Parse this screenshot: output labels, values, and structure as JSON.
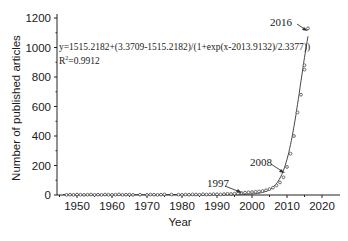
{
  "chart_data": {
    "type": "scatter",
    "title": "",
    "xlabel": "Year",
    "ylabel": "Number of published articles",
    "xlim": [
      1944,
      2020
    ],
    "ylim": [
      0,
      1200
    ],
    "xticks": [
      1950,
      1960,
      1970,
      1980,
      1990,
      2000,
      2010,
      2020
    ],
    "yticks": [
      0,
      200,
      400,
      600,
      800,
      1000,
      1200
    ],
    "grid": false,
    "legend": null,
    "fit": {
      "type": "logistic",
      "equation": "y=1515.2182+(3.3709-1515.2182)/(1+exp(x-2013.9132)/2.3377))",
      "r_squared_label": "R",
      "r_squared_sup": "2",
      "r_squared_value": "=0.9912",
      "A1": 3.3709,
      "A2": 1515.2182,
      "x0": 2013.9132,
      "dx": 2.3377
    },
    "series": [
      {
        "name": "Published articles",
        "marker": "open-circle",
        "x": [
          1947,
          1948,
          1949,
          1950,
          1951,
          1952,
          1953,
          1954,
          1955,
          1956,
          1957,
          1958,
          1959,
          1960,
          1961,
          1962,
          1963,
          1964,
          1965,
          1966,
          1968,
          1970,
          1971,
          1972,
          1973,
          1974,
          1975,
          1977,
          1979,
          1980,
          1981,
          1982,
          1983,
          1984,
          1985,
          1986,
          1987,
          1988,
          1989,
          1990,
          1991,
          1992,
          1993,
          1994,
          1995,
          1996,
          1997,
          1998,
          1999,
          2000,
          2001,
          2002,
          2003,
          2004,
          2005,
          2006,
          2007,
          2008,
          2009,
          2010,
          2011,
          2012,
          2013,
          2014,
          2015,
          2015,
          2016
        ],
        "y": [
          1,
          2,
          1,
          3,
          2,
          1,
          2,
          3,
          1,
          2,
          1,
          3,
          2,
          1,
          2,
          4,
          1,
          2,
          3,
          1,
          2,
          1,
          3,
          2,
          1,
          2,
          4,
          3,
          2,
          1,
          3,
          2,
          4,
          3,
          2,
          5,
          3,
          4,
          6,
          5,
          4,
          6,
          8,
          7,
          9,
          10,
          14,
          16,
          18,
          20,
          22,
          24,
          27,
          32,
          40,
          50,
          65,
          85,
          120,
          190,
          280,
          400,
          560,
          680,
          880,
          850,
          1130
        ]
      }
    ],
    "annotations": [
      {
        "text": "1997",
        "x": 1997,
        "y": 14
      },
      {
        "text": "2008",
        "x": 2008,
        "y": 120
      },
      {
        "text": "2016",
        "x": 2016,
        "y": 1130
      }
    ]
  }
}
